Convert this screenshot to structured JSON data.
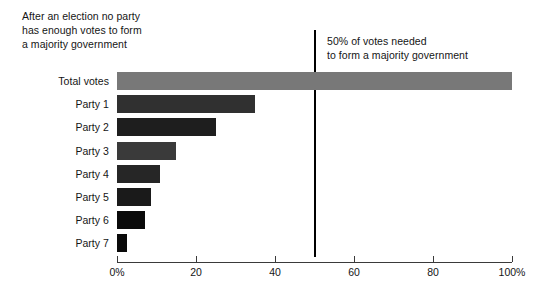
{
  "chart_data": {
    "type": "bar",
    "orientation": "horizontal",
    "title": "",
    "xlabel": "",
    "ylabel": "",
    "xlim": [
      0,
      100
    ],
    "grid": false,
    "legend": "none",
    "categories": [
      "Total votes",
      "Party 1",
      "Party 2",
      "Party 3",
      "Party 4",
      "Party 5",
      "Party 6",
      "Party 7"
    ],
    "values": [
      100,
      35,
      25,
      15,
      11,
      8.5,
      7,
      2.5
    ],
    "bar_colors": [
      "#787878",
      "#303030",
      "#1e1e1e",
      "#3a3a3a",
      "#262626",
      "#1a1a1a",
      "#0a0a0a",
      "#0a0a0a"
    ],
    "x_ticks": [
      0,
      20,
      40,
      60,
      80,
      100
    ],
    "x_tick_labels": [
      "0%",
      "20",
      "40",
      "60",
      "80",
      "100%"
    ],
    "annotations": [
      {
        "name": "election-note",
        "text": "After an election no party\nhas enough votes to form\na majority government"
      },
      {
        "name": "majority-threshold-note",
        "text": "50% of votes needed\nto form a majority government"
      }
    ],
    "reference_line": {
      "value": 50,
      "color": "#000000",
      "label": "50% of votes needed"
    }
  }
}
